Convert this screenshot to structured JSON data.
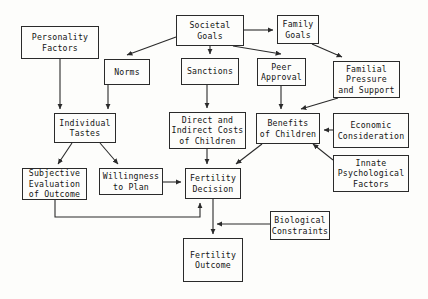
{
  "diagram": {
    "type": "flowchart",
    "stroke_color": "#2a2a2a",
    "background_color": "#fdfdfb",
    "nodes": [
      {
        "id": "personality_factors",
        "label": "Personality\nFactors",
        "x": 21,
        "y": 26,
        "w": 78,
        "h": 33
      },
      {
        "id": "societal_goals",
        "label": "Societal\nGoals",
        "x": 176,
        "y": 15,
        "w": 68,
        "h": 31
      },
      {
        "id": "family_goals",
        "label": "Family\nGoals",
        "x": 277,
        "y": 15,
        "w": 42,
        "h": 29
      },
      {
        "id": "norms",
        "label": "Norms",
        "x": 104,
        "y": 59,
        "w": 46,
        "h": 26
      },
      {
        "id": "sanctions",
        "label": "Sanctions",
        "x": 181,
        "y": 58,
        "w": 58,
        "h": 27
      },
      {
        "id": "peer_approval",
        "label": "Peer\nApproval",
        "x": 257,
        "y": 58,
        "w": 49,
        "h": 28
      },
      {
        "id": "familial_pressure",
        "label": "Familial\nPressure\nand Support",
        "x": 333,
        "y": 61,
        "w": 67,
        "h": 37
      },
      {
        "id": "individual_tastes",
        "label": "Individual\nTastes",
        "x": 54,
        "y": 113,
        "w": 62,
        "h": 30
      },
      {
        "id": "direct_indirect_costs",
        "label": "Direct and\nIndirect Costs\nof Children",
        "x": 169,
        "y": 112,
        "w": 77,
        "h": 37
      },
      {
        "id": "benefits_of_children",
        "label": "Benefits\nof Children",
        "x": 256,
        "y": 113,
        "w": 64,
        "h": 31
      },
      {
        "id": "economic_consideration",
        "label": "Economic\nConsideration",
        "x": 333,
        "y": 113,
        "w": 76,
        "h": 35
      },
      {
        "id": "innate_psychological",
        "label": "Innate\nPsychological\nFactors",
        "x": 333,
        "y": 155,
        "w": 76,
        "h": 37
      },
      {
        "id": "subjective_evaluation",
        "label": "Subjective\nEvaluation\nof Outcome",
        "x": 22,
        "y": 168,
        "w": 65,
        "h": 32
      },
      {
        "id": "willingness_to_plan",
        "label": "Willingness\nto Plan",
        "x": 99,
        "y": 168,
        "w": 64,
        "h": 27
      },
      {
        "id": "fertility_decision",
        "label": "Fertility\nDecision",
        "x": 185,
        "y": 168,
        "w": 56,
        "h": 31
      },
      {
        "id": "biological_constraints",
        "label": "Biological\nConstraints",
        "x": 270,
        "y": 211,
        "w": 60,
        "h": 29
      },
      {
        "id": "fertility_outcome",
        "label": "Fertility\nOutcome",
        "x": 183,
        "y": 238,
        "w": 60,
        "h": 44
      }
    ],
    "edges": [
      {
        "from": "personality_factors",
        "to": "individual_tastes",
        "path": "M 60,59 L 60,109"
      },
      {
        "from": "societal_goals",
        "to": "norms",
        "path": "M 176,37 L 127,55"
      },
      {
        "from": "societal_goals",
        "to": "family_goals",
        "path": "M 244,30 L 273,30"
      },
      {
        "from": "societal_goals",
        "to": "sanctions",
        "path": "M 210,46 L 210,54"
      },
      {
        "from": "societal_goals",
        "to": "peer_approval",
        "path": "M 233,46 L 281,54"
      },
      {
        "from": "family_goals",
        "to": "familial_pressure",
        "path": "M 312,44 L 342,57"
      },
      {
        "from": "norms",
        "to": "individual_tastes",
        "path": "M 108,85 L 108,109"
      },
      {
        "from": "sanctions",
        "to": "direct_indirect_costs",
        "path": "M 207,85 L 207,108"
      },
      {
        "from": "peer_approval",
        "to": "benefits_of_children",
        "path": "M 281,86 L 281,109"
      },
      {
        "from": "familial_pressure",
        "to": "benefits_of_children",
        "path": "M 338,98 L 301,109"
      },
      {
        "from": "economic_consideration",
        "to": "benefits_of_children",
        "path": "M 333,130 L 324,130"
      },
      {
        "from": "innate_psychological",
        "to": "benefits_of_children",
        "path": "M 333,160 L 313,144"
      },
      {
        "from": "individual_tastes",
        "to": "subjective_evaluation",
        "path": "M 72,143 L 58,164"
      },
      {
        "from": "individual_tastes",
        "to": "willingness_to_plan",
        "path": "M 100,143 L 118,164"
      },
      {
        "from": "direct_indirect_costs",
        "to": "fertility_decision",
        "path": "M 207,149 L 207,164"
      },
      {
        "from": "benefits_of_children",
        "to": "fertility_decision",
        "path": "M 262,144 L 236,164"
      },
      {
        "from": "willingness_to_plan",
        "to": "fertility_decision",
        "path": "M 163,182 L 181,182"
      },
      {
        "from": "subjective_evaluation",
        "to": "fertility_decision",
        "path": "M 55,200 L 55,217 L 200,217 L 200,203"
      },
      {
        "from": "fertility_decision",
        "to": "fertility_outcome",
        "path": "M 213,199 L 213,234"
      },
      {
        "from": "biological_constraints",
        "to": "fertility_outcome",
        "path": "M 270,224 L 217,224"
      }
    ]
  }
}
